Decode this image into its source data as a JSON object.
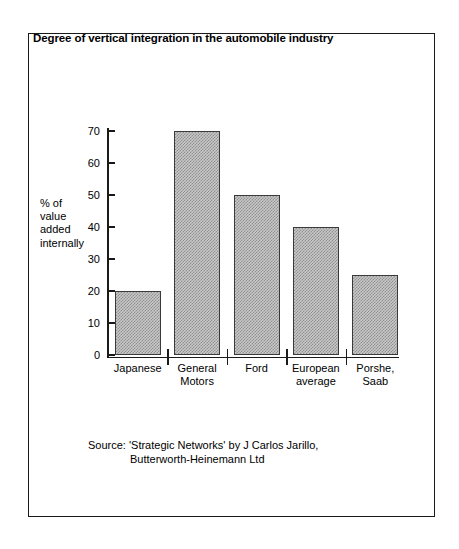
{
  "chart_data": {
    "type": "bar",
    "title": "Degree of vertical integration in the automobile industry",
    "categories": [
      "Japanese",
      "General Motors",
      "Ford",
      "European average",
      "Porshe, Saab"
    ],
    "category_lines": [
      [
        "Japanese"
      ],
      [
        "General",
        "Motors"
      ],
      [
        "Ford"
      ],
      [
        "European",
        "average"
      ],
      [
        "Porshe,",
        "Saab"
      ]
    ],
    "values": [
      20,
      70,
      50,
      40,
      25
    ],
    "xlabel": "",
    "ylabel": "% of value added internally",
    "ylabel_lines": [
      "% of",
      "value",
      "added",
      "internally"
    ],
    "ylim": [
      0,
      70
    ],
    "yticks": [
      0,
      10,
      20,
      30,
      40,
      50,
      60,
      70
    ],
    "ytick_labels": [
      "0",
      "10",
      "20",
      "30",
      "40",
      "50",
      "60",
      "70"
    ],
    "grid": false,
    "legend": false,
    "bar_fill": "#c9c9c9",
    "bar_pattern": "checkerboard-dither",
    "bar_edge_color": "#3a3a3a",
    "axis_color": "#1a1a1a"
  },
  "source": {
    "line1": "Source:  'Strategic Networks' by J Carlos Jarillo,",
    "line2": "Butterworth-Heinemann Ltd"
  }
}
